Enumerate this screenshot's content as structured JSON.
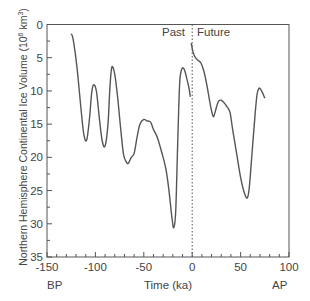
{
  "chart_data": {
    "type": "line",
    "title": "",
    "xlabel": "Time (ka)",
    "ylabel": "Northern Hemisphere Continental Ice Volume (10^6 km^3)",
    "ylabel_main": "Northern Hemisphere Continental Ice Volume (10",
    "ylabel_exp": "6",
    "ylabel_tail": " km",
    "ylabel_exp2": "3",
    "ylabel_close": ")",
    "xlim": [
      -150,
      100
    ],
    "ylim": [
      35,
      0
    ],
    "y_inverted": true,
    "xticks": [
      -150,
      -100,
      -50,
      0,
      50,
      100
    ],
    "xtick_labels": [
      "-150",
      "-100",
      "-50",
      "0",
      "50",
      "100"
    ],
    "yticks": [
      0,
      5,
      10,
      15,
      20,
      25,
      30,
      35
    ],
    "ytick_labels": [
      "0",
      "5",
      "10",
      "15",
      "20",
      "25",
      "30",
      "35"
    ],
    "grid": false,
    "annotations": {
      "past": "Past",
      "future": "Future",
      "bp": "BP",
      "ap": "AP",
      "divider_x": 0
    },
    "series": [
      {
        "name": "Past",
        "x": [
          -125,
          -123,
          -119,
          -115,
          -112,
          -109,
          -106,
          -104,
          -102,
          -99,
          -96,
          -93,
          -90,
          -87,
          -85,
          -83,
          -80,
          -77,
          -74,
          -71,
          -68,
          -66,
          -63,
          -60,
          -57,
          -54,
          -50,
          -47,
          -43,
          -40,
          -36,
          -31,
          -27,
          -24,
          -21,
          -19,
          -17,
          -15,
          -13,
          -11,
          -9,
          -7,
          -5,
          -3,
          -2
        ],
        "values": [
          1.4,
          2.2,
          6.5,
          12.5,
          16.5,
          17.4,
          14,
          10.5,
          9.1,
          10,
          14,
          17.5,
          18.3,
          15,
          9.5,
          6.4,
          7.5,
          11,
          15.5,
          19.5,
          20.7,
          20.9,
          20,
          19.4,
          17,
          15,
          14.3,
          14.5,
          14.7,
          15.8,
          17,
          19.5,
          21.9,
          25,
          29,
          30.6,
          28,
          18,
          9,
          6.8,
          6.6,
          7.3,
          8.5,
          9.8,
          10.9
        ]
      },
      {
        "name": "Future",
        "x": [
          -1,
          1,
          3,
          6,
          9,
          12,
          15,
          18,
          20,
          22,
          24,
          27,
          30,
          33,
          36,
          39,
          42,
          46,
          50,
          54,
          57,
          59,
          62,
          65,
          67,
          69,
          71,
          73,
          75
        ],
        "values": [
          2.8,
          4.2,
          4.9,
          5.4,
          5.8,
          7,
          9,
          11.5,
          13,
          13.9,
          13,
          11.6,
          11.4,
          11.8,
          12.4,
          13.2,
          16,
          19.5,
          23,
          25.4,
          26.1,
          24.5,
          19,
          13.5,
          10.5,
          9.6,
          9.8,
          10.4,
          11.1
        ]
      }
    ]
  }
}
